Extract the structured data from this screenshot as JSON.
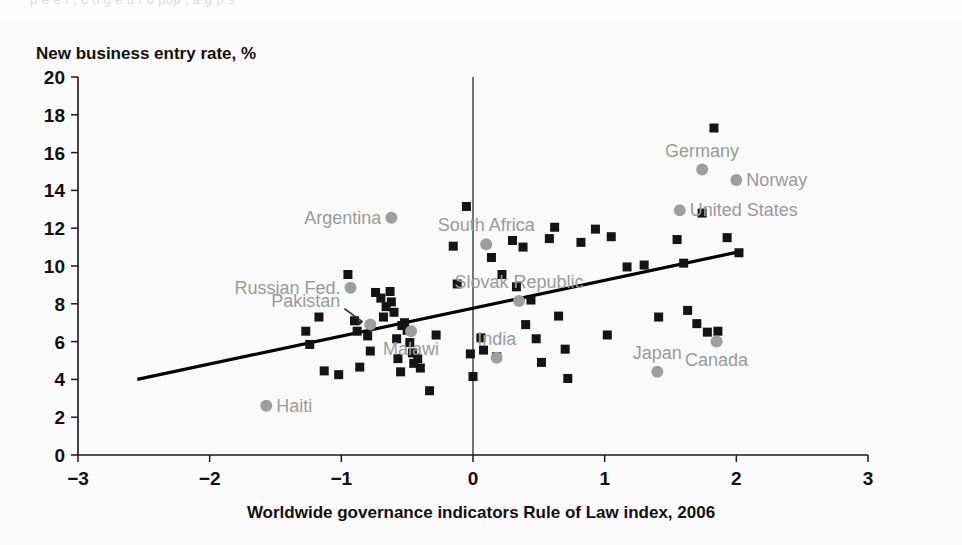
{
  "figure": {
    "bleed_text": "p    e      e     t  , c  u      g             e  u     f  o    pop     , a g          p       s"
  },
  "chart_data": {
    "type": "scatter",
    "title": "",
    "ylabel": "New business entry rate, %",
    "xlabel": "Worldwide governance indicators Rule of Law index, 2006",
    "xlim": [
      -3,
      3
    ],
    "ylim": [
      0,
      20
    ],
    "xticks": [
      -3,
      -2,
      -1,
      0,
      1,
      2,
      3
    ],
    "xtick_labels": [
      "−3",
      "−2",
      "−1",
      "0",
      "1",
      "2",
      "3"
    ],
    "yticks": [
      0,
      2,
      4,
      6,
      8,
      10,
      12,
      14,
      16,
      18,
      20
    ],
    "ytick_labels": [
      "0",
      "2",
      "4",
      "6",
      "8",
      "10",
      "12",
      "14",
      "16",
      "18",
      "20"
    ],
    "grid": false,
    "legend": false,
    "zero_reference_line_x": 0,
    "trendline": {
      "label": "linear fit",
      "x0": -2.55,
      "y0": 4.0,
      "x1": 2.02,
      "y1": 10.75
    },
    "series": [
      {
        "name": "Countries",
        "marker": "square",
        "color": "#141414",
        "points": [
          {
            "x": -1.27,
            "y": 6.55
          },
          {
            "x": -1.24,
            "y": 5.85
          },
          {
            "x": -1.17,
            "y": 7.3
          },
          {
            "x": -1.13,
            "y": 4.45
          },
          {
            "x": -1.02,
            "y": 4.25
          },
          {
            "x": -0.95,
            "y": 9.55
          },
          {
            "x": -0.9,
            "y": 7.1
          },
          {
            "x": -0.88,
            "y": 6.55
          },
          {
            "x": -0.86,
            "y": 4.65
          },
          {
            "x": -0.8,
            "y": 6.3
          },
          {
            "x": -0.78,
            "y": 5.5
          },
          {
            "x": -0.74,
            "y": 8.6
          },
          {
            "x": -0.7,
            "y": 8.3
          },
          {
            "x": -0.68,
            "y": 7.3
          },
          {
            "x": -0.66,
            "y": 7.85
          },
          {
            "x": -0.63,
            "y": 8.65
          },
          {
            "x": -0.62,
            "y": 8.1
          },
          {
            "x": -0.6,
            "y": 7.55
          },
          {
            "x": -0.58,
            "y": 6.15
          },
          {
            "x": -0.57,
            "y": 5.1
          },
          {
            "x": -0.55,
            "y": 4.4
          },
          {
            "x": -0.54,
            "y": 6.85
          },
          {
            "x": -0.52,
            "y": 7.0
          },
          {
            "x": -0.5,
            "y": 6.6
          },
          {
            "x": -0.48,
            "y": 5.95
          },
          {
            "x": -0.46,
            "y": 5.4
          },
          {
            "x": -0.45,
            "y": 4.85
          },
          {
            "x": -0.42,
            "y": 5.1
          },
          {
            "x": -0.4,
            "y": 4.6
          },
          {
            "x": -0.33,
            "y": 3.4
          },
          {
            "x": -0.28,
            "y": 6.35
          },
          {
            "x": -0.15,
            "y": 11.05
          },
          {
            "x": -0.12,
            "y": 9.05
          },
          {
            "x": -0.05,
            "y": 13.15
          },
          {
            "x": -0.02,
            "y": 5.35
          },
          {
            "x": 0.0,
            "y": 4.15
          },
          {
            "x": 0.06,
            "y": 6.2
          },
          {
            "x": 0.08,
            "y": 5.55
          },
          {
            "x": 0.14,
            "y": 10.45
          },
          {
            "x": 0.18,
            "y": 5.2
          },
          {
            "x": 0.22,
            "y": 9.55
          },
          {
            "x": 0.3,
            "y": 11.35
          },
          {
            "x": 0.33,
            "y": 8.9
          },
          {
            "x": 0.38,
            "y": 11.0
          },
          {
            "x": 0.4,
            "y": 6.9
          },
          {
            "x": 0.44,
            "y": 8.2
          },
          {
            "x": 0.48,
            "y": 6.15
          },
          {
            "x": 0.52,
            "y": 4.9
          },
          {
            "x": 0.58,
            "y": 11.45
          },
          {
            "x": 0.62,
            "y": 12.05
          },
          {
            "x": 0.65,
            "y": 7.35
          },
          {
            "x": 0.7,
            "y": 5.6
          },
          {
            "x": 0.72,
            "y": 4.05
          },
          {
            "x": 0.82,
            "y": 11.25
          },
          {
            "x": 0.93,
            "y": 11.95
          },
          {
            "x": 1.02,
            "y": 6.35
          },
          {
            "x": 1.05,
            "y": 11.55
          },
          {
            "x": 1.17,
            "y": 9.95
          },
          {
            "x": 1.3,
            "y": 10.05
          },
          {
            "x": 1.41,
            "y": 7.3
          },
          {
            "x": 1.55,
            "y": 11.4
          },
          {
            "x": 1.6,
            "y": 10.15
          },
          {
            "x": 1.63,
            "y": 7.65
          },
          {
            "x": 1.7,
            "y": 6.95
          },
          {
            "x": 1.74,
            "y": 12.8
          },
          {
            "x": 1.78,
            "y": 6.5
          },
          {
            "x": 1.83,
            "y": 17.3
          },
          {
            "x": 1.86,
            "y": 6.55
          },
          {
            "x": 1.93,
            "y": 11.5
          },
          {
            "x": 2.02,
            "y": 10.7
          }
        ]
      },
      {
        "name": "Highlighted countries",
        "marker": "circle",
        "color": "#9e9e9e",
        "points": [
          {
            "label": "Argentina",
            "x": -0.62,
            "y": 12.55,
            "label_side": "left"
          },
          {
            "label": "Russian Fed.",
            "x": -0.93,
            "y": 8.85,
            "label_side": "left"
          },
          {
            "label": "Pakistan",
            "x": -0.78,
            "y": 6.9,
            "label_side": "left-leader"
          },
          {
            "label": "Haiti",
            "x": -1.57,
            "y": 2.6,
            "label_side": "right"
          },
          {
            "label": "South Africa",
            "x": 0.1,
            "y": 11.15,
            "label_side": "above"
          },
          {
            "label": "Slovak Republic",
            "x": 0.35,
            "y": 8.15,
            "label_side": "above"
          },
          {
            "label": "Malawi",
            "x": -0.47,
            "y": 6.55,
            "label_side": "below"
          },
          {
            "label": "India",
            "x": 0.18,
            "y": 5.15,
            "label_side": "above"
          },
          {
            "label": "Germany",
            "x": 1.74,
            "y": 15.1,
            "label_side": "above"
          },
          {
            "label": "Norway",
            "x": 2.0,
            "y": 14.55,
            "label_side": "right"
          },
          {
            "label": "United States",
            "x": 1.57,
            "y": 12.95,
            "label_side": "right"
          },
          {
            "label": "Japan",
            "x": 1.4,
            "y": 4.4,
            "label_side": "above"
          },
          {
            "label": "Canada",
            "x": 1.85,
            "y": 6.0,
            "label_side": "below"
          }
        ]
      }
    ]
  },
  "labels": {
    "ytitle": "New business entry rate, %",
    "xtitle": "Worldwide governance indicators Rule of Law index, 2006"
  }
}
